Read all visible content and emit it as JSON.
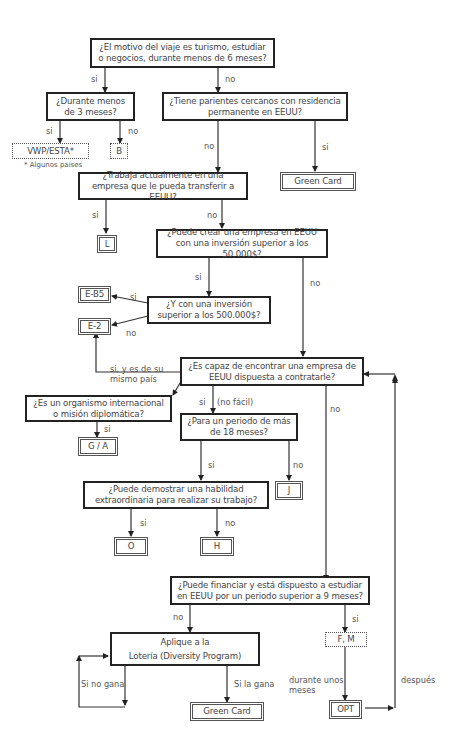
{
  "diagram": {
    "type": "flowchart",
    "language": "es",
    "questions": {
      "q1": "¿El motivo del viaje es turismo, estudiar o negocios, durante menos de 6 meses?",
      "q2": "¿Durante menos de 3 meses?",
      "q3": "¿Tiene parientes cercanos con residencia permanente en EEUU?",
      "q4": "¿Trabaja actualmente en una empresa que le pueda transferir a EEUU?",
      "q5": "¿Puede crear una empresa en EEUU con una inversión superior a los 50.000$?",
      "q6": "¿Y con una inversión superior a los 500.000$?",
      "q7": "¿Es capaz de encontrar una empresa de EEUU dispuesta a contratarle?",
      "q8": "¿Es un organismo internacional o misión diplomática?",
      "q9": "¿Para un periodo de más de 18 meses?",
      "q10": "¿Puede demostrar una habilidad extraordinaria para realizar su trabajo?",
      "q11": "¿Puede financiar y está dispuesto a estudiar en EEUU por un periodo superior a 9 meses?",
      "q12_line1": "Aplique a la",
      "q12_line2": "Lotería (Diversity Program)"
    },
    "outcomes": {
      "vwp": "VWP/ESTA*",
      "b": "B",
      "green_card_1": "Green Card",
      "l": "L",
      "eb5": "E-B5",
      "e2": "E-2",
      "ga": "G / A",
      "j": "J",
      "o": "O",
      "h": "H",
      "fm": "F, M",
      "opt": "OPT",
      "green_card_2": "Green Card"
    },
    "footnote": "* Algunos países",
    "edge_labels": {
      "q1_yes": "si",
      "q1_no": "no",
      "q2_yes": "si",
      "q2_no": "no",
      "q3_no": "no",
      "q3_yes": "si",
      "q4_yes": "si",
      "q4_no": "no",
      "q5_yes": "si",
      "q5_no": "no",
      "q6_yes": "si",
      "q6_no": "no",
      "q7_same_country": "si, y es de su mismo país",
      "q7_yes": "si",
      "q7_yes_note": "(no fácil)",
      "q7_no": "no",
      "q8_yes": "si",
      "q9_yes": "si",
      "q9_no": "no",
      "q10_yes": "si",
      "q10_no": "no",
      "q11_no": "no",
      "q11_yes": "si",
      "lottery_lose": "Si no gana",
      "lottery_win": "Si la gana",
      "fm_to_opt": "durante unos meses",
      "opt_after": "después"
    }
  }
}
